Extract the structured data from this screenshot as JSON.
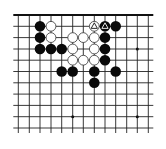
{
  "board": {
    "cols": 13,
    "rows": 11,
    "col_x": [
      18.3,
      29.3,
      40,
      51,
      61.7,
      72.7,
      83.3,
      94.3,
      105,
      115.7,
      126.7,
      137.3,
      148.3
    ],
    "row_y": [
      15,
      26.3,
      37.6,
      49,
      60.2,
      71.5,
      82.8,
      94.1,
      105.4,
      116.7,
      128
    ],
    "top_edge": true,
    "stub_length": 5,
    "line_color": "#222222",
    "edge_color": "#111111",
    "stone_radius": 5.3,
    "star_points": [
      [
        5,
        9
      ],
      [
        11,
        3
      ],
      [
        11,
        9
      ]
    ],
    "colors": {
      "black": "#0a0a0a",
      "white": "#ffffff",
      "white_outline": "#333333"
    }
  },
  "stones": [
    {
      "color": "black",
      "col": 2,
      "row": 1
    },
    {
      "color": "black",
      "col": 2,
      "row": 2
    },
    {
      "color": "black",
      "col": 2,
      "row": 3
    },
    {
      "color": "black",
      "col": 3,
      "row": 3
    },
    {
      "color": "black",
      "col": 4,
      "row": 3
    },
    {
      "color": "white",
      "col": 3,
      "row": 1
    },
    {
      "color": "white",
      "col": 3,
      "row": 2
    },
    {
      "color": "white",
      "col": 5,
      "row": 2
    },
    {
      "color": "white",
      "col": 6,
      "row": 2
    },
    {
      "color": "white",
      "col": 7,
      "row": 2
    },
    {
      "color": "white",
      "col": 5,
      "row": 3
    },
    {
      "color": "white",
      "col": 7,
      "row": 3
    },
    {
      "color": "white",
      "col": 5,
      "row": 4
    },
    {
      "color": "white",
      "col": 6,
      "row": 4
    },
    {
      "color": "white",
      "col": 7,
      "row": 4
    },
    {
      "color": "white",
      "col": 7,
      "row": 1,
      "mark": "triangle"
    },
    {
      "color": "black",
      "col": 8,
      "row": 1,
      "mark": "triangle"
    },
    {
      "color": "black",
      "col": 9,
      "row": 1
    },
    {
      "color": "black",
      "col": 8,
      "row": 2
    },
    {
      "color": "black",
      "col": 8,
      "row": 3
    },
    {
      "color": "black",
      "col": 8,
      "row": 4
    },
    {
      "color": "black",
      "col": 4,
      "row": 5
    },
    {
      "color": "black",
      "col": 5,
      "row": 5
    },
    {
      "color": "black",
      "col": 7,
      "row": 5
    },
    {
      "color": "black",
      "col": 7,
      "row": 6
    },
    {
      "color": "black",
      "col": 9,
      "row": 5
    }
  ]
}
